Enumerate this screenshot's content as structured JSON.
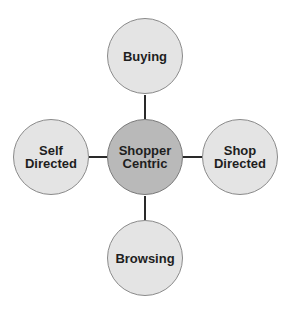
{
  "diagram": {
    "type": "hub-and-spoke",
    "colors": {
      "outer_fill": "#e4e4e4",
      "center_fill": "#b9b9b9",
      "connector": "#2a2a2a",
      "text": "#1e1e1e"
    },
    "center": {
      "line1": "Shopper",
      "line2": "Centric"
    },
    "top": {
      "line1": "Buying"
    },
    "left": {
      "line1": "Self",
      "line2": "Directed"
    },
    "right": {
      "line1": "Shop",
      "line2": "Directed"
    },
    "bottom": {
      "line1": "Browsing"
    }
  }
}
